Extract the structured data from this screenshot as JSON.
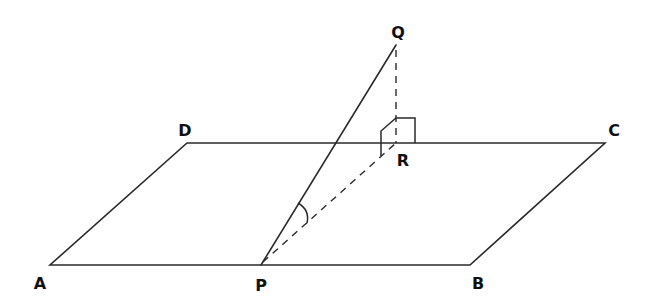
{
  "diagram": {
    "type": "3d-geometry-plane-line-angle",
    "points": {
      "A": {
        "label": "A",
        "x": 50,
        "y": 265,
        "lx": 40,
        "ly": 289
      },
      "B": {
        "label": "B",
        "x": 470,
        "y": 265,
        "lx": 478,
        "ly": 289
      },
      "C": {
        "label": "C",
        "x": 605,
        "y": 143,
        "lx": 614,
        "ly": 136
      },
      "D": {
        "label": "D",
        "x": 187,
        "y": 143,
        "lx": 185,
        "ly": 136
      },
      "P": {
        "label": "P",
        "x": 261,
        "y": 265,
        "lx": 261,
        "ly": 291
      },
      "Q": {
        "label": "Q",
        "x": 396,
        "y": 45,
        "lx": 398,
        "ly": 38
      },
      "R": {
        "label": "R",
        "x": 396,
        "y": 143,
        "lx": 403,
        "ly": 166
      }
    },
    "segments": [
      {
        "from": "A",
        "to": "B",
        "style": "solid"
      },
      {
        "from": "B",
        "to": "C",
        "style": "solid"
      },
      {
        "from": "C",
        "to": "D",
        "style": "solid"
      },
      {
        "from": "D",
        "to": "A",
        "style": "solid"
      },
      {
        "from": "P",
        "to": "Q",
        "style": "solid"
      },
      {
        "from": "Q",
        "to": "R",
        "style": "dashed"
      },
      {
        "from": "P",
        "to": "R",
        "style": "dashed"
      }
    ],
    "annotations": {
      "angle_at": "P",
      "angle_between": [
        "PQ",
        "PR"
      ],
      "right_angle_at": "R"
    },
    "colors": {
      "line": "#2a2a2a",
      "label": "#111111",
      "background": "#ffffff"
    }
  }
}
